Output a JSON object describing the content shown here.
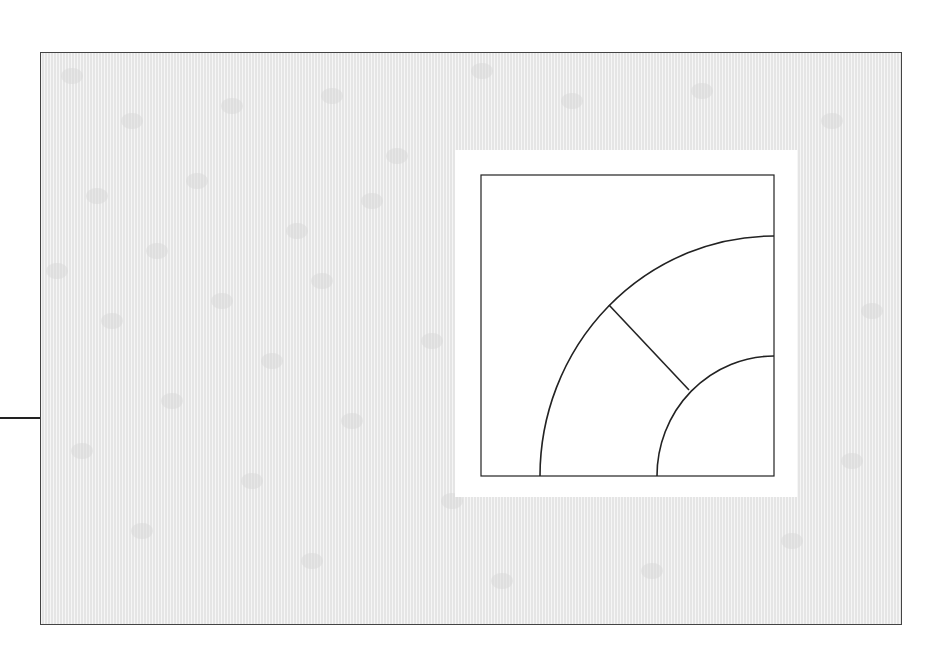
{
  "diagram": {
    "colors": {
      "background": "#ffffff",
      "panel_fill": "#ececec",
      "panel_border": "#444444",
      "line": "#222222"
    },
    "panel": {
      "x": 40,
      "y": 52,
      "width": 861,
      "height": 572
    },
    "leader_line": {
      "x1": 0,
      "y1": 418,
      "x2": 40,
      "y2": 418
    },
    "white_patch": {
      "x": 455,
      "y": 150,
      "width": 342,
      "height": 347
    },
    "square": {
      "x": 481,
      "y": 175,
      "width": 293,
      "height": 301
    },
    "arcs": {
      "center": [
        774,
        476
      ],
      "outer_radius": 236,
      "inner_radius": 118
    },
    "radial_line": {
      "x1": 609,
      "y1": 305,
      "x2": 689,
      "y2": 390
    }
  }
}
